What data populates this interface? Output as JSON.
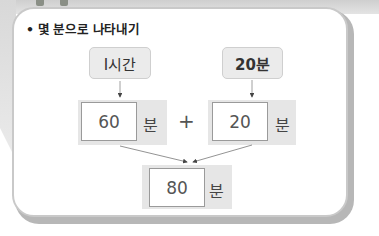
{
  "title": "• 몇 분으로 나타내기",
  "top_boxes": {
    "left": "I시간",
    "right": "20분"
  },
  "row1": {
    "left_value": "60",
    "left_unit": "분",
    "operator": "+",
    "right_value": "20",
    "right_unit": "분"
  },
  "result": {
    "value": "80",
    "unit": "분"
  },
  "colors": {
    "box_fill": "#ebebeb",
    "band_fill": "#e6e6e6",
    "border": "#c9c9c9",
    "text": "#333333"
  }
}
